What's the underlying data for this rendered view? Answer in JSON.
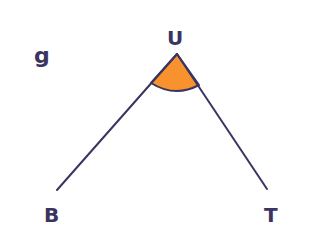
{
  "diagram": {
    "type": "angle",
    "figure_label": "g",
    "vertices": {
      "vertex": {
        "name": "U",
        "x": 177,
        "y": 54
      },
      "left": {
        "name": "B",
        "x": 57,
        "y": 190
      },
      "right": {
        "name": "T",
        "x": 267,
        "y": 189
      }
    },
    "marked_angle": "BUT",
    "colors": {
      "line": "#3b3461",
      "angle_fill": "#f7922e",
      "background": "#ffffff"
    }
  }
}
